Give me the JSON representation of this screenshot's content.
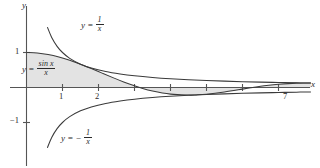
{
  "chart_data": {
    "type": "line",
    "title": "",
    "xlabel": "x",
    "ylabel": "y",
    "xlim": [
      -0.35,
      7.9
    ],
    "ylim": [
      -1.45,
      1.45
    ],
    "grid": false,
    "legend": "inline-annotations",
    "xticks": [
      1,
      2,
      3,
      4,
      5,
      6,
      7
    ],
    "xtick_labels_shown": [
      "1",
      "2",
      "7"
    ],
    "yticks": [
      1,
      -1
    ],
    "ytick_labels_shown": [
      "1",
      "-1"
    ],
    "shaded_region": {
      "description": "region between y = sin(x)/x and the x-axis",
      "fill": "#e3e3e3",
      "x_from": 0,
      "x_to": 7.9
    },
    "series": [
      {
        "name": "y = 1/x",
        "expression": "1/x",
        "label": "y = 1/x",
        "color": "#3a3a3a",
        "x": [
          0.58,
          0.7,
          0.85,
          1.0,
          1.2,
          1.5,
          1.8,
          2.2,
          2.6,
          3.0,
          3.5,
          4.0,
          4.5,
          5.0,
          5.5,
          6.0,
          6.5,
          7.0,
          7.5,
          7.9
        ],
        "y": [
          1.724,
          1.429,
          1.176,
          1.0,
          0.833,
          0.667,
          0.556,
          0.455,
          0.385,
          0.333,
          0.286,
          0.25,
          0.222,
          0.2,
          0.182,
          0.167,
          0.154,
          0.143,
          0.133,
          0.127
        ]
      },
      {
        "name": "y = sin(x)/x",
        "expression": "sin(x)/x",
        "label": "y = sin x / x",
        "color": "#3a3a3a",
        "x": [
          0.0,
          0.3,
          0.6,
          0.9,
          1.2,
          1.5,
          1.8,
          2.1,
          2.4,
          2.7,
          3.0,
          3.1416,
          3.5,
          4.0,
          4.5,
          4.7124,
          5.0,
          5.5,
          6.0,
          6.2832,
          6.6,
          7.0,
          7.5,
          7.9
        ],
        "y": [
          1.0,
          0.985,
          0.941,
          0.87,
          0.777,
          0.665,
          0.541,
          0.411,
          0.282,
          0.159,
          0.047,
          0.0,
          -0.1,
          -0.189,
          -0.217,
          -0.212,
          -0.192,
          -0.128,
          -0.047,
          0.0,
          0.052,
          0.094,
          0.125,
          0.126
        ]
      },
      {
        "name": "y = -1/x",
        "expression": "-1/x",
        "label": "y = -1/x",
        "color": "#3a3a3a",
        "x": [
          0.58,
          0.7,
          0.85,
          1.0,
          1.2,
          1.5,
          1.8,
          2.2,
          2.6,
          3.0,
          3.5,
          4.0,
          4.5,
          5.0,
          5.5,
          6.0,
          6.5,
          7.0,
          7.5,
          7.9
        ],
        "y": [
          -1.724,
          -1.429,
          -1.176,
          -1.0,
          -0.833,
          -0.667,
          -0.556,
          -0.455,
          -0.385,
          -0.333,
          -0.286,
          -0.25,
          -0.222,
          -0.2,
          -0.182,
          -0.167,
          -0.154,
          -0.143,
          -0.133,
          -0.127
        ]
      }
    ]
  },
  "annotations": {
    "curve_label_upper": {
      "lhs": "y =",
      "num": "1",
      "den": "x"
    },
    "curve_label_middle": {
      "lhs": "y =",
      "num": "sin x",
      "den": "x"
    },
    "curve_label_lower": {
      "lhs": "y = −",
      "num": "1",
      "den": "x"
    }
  },
  "axis_labels": {
    "x": "x",
    "y": "y"
  },
  "tick_labels": {
    "x1": "1",
    "x2": "2",
    "x7": "7",
    "y1": "1",
    "ym1": "−1"
  },
  "colors": {
    "curve": "#3a3a3a",
    "axis": "#555555",
    "shade": "#e3e3e3",
    "text": "#2b2b2b"
  }
}
